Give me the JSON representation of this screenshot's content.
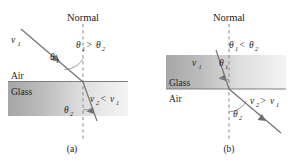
{
  "figure": {
    "caption_a": "(a)",
    "caption_b": "(b)"
  },
  "colors": {
    "background": "#ffffff",
    "ray": "#6f6f6f",
    "normal": "#8e8e8e",
    "interface": "#6f6f6f",
    "glass_dark": "#a9a9a9",
    "glass_light": "#f2f2f2",
    "text": "#1d1d1d"
  },
  "panel_a": {
    "label": "(a)",
    "normal_label": "Normal",
    "medium_upper": "Air",
    "medium_lower": "Glass",
    "incident_speed": {
      "symbol": "v",
      "subscript": "1"
    },
    "angle_incident": {
      "symbol": "θ",
      "subscript": "1"
    },
    "angle_refracted": {
      "symbol": "θ",
      "subscript": "2"
    },
    "angle_relation": {
      "left_symbol": "θ",
      "left_sub": "1",
      "operator": ">",
      "right_symbol": "θ",
      "right_sub": "2"
    },
    "speed_relation": {
      "left_symbol": "v",
      "left_sub": "2",
      "operator": "<",
      "right_symbol": "v",
      "right_sub": "1"
    }
  },
  "panel_b": {
    "label": "(b)",
    "normal_label": "Normal",
    "medium_upper": "Glass",
    "medium_lower": "Air",
    "incident_speed": {
      "symbol": "v",
      "subscript": "1"
    },
    "angle_incident": {
      "symbol": "θ",
      "subscript": "1"
    },
    "angle_refracted": {
      "symbol": "θ",
      "subscript": "2"
    },
    "angle_relation": {
      "left_symbol": "θ",
      "left_sub": "1",
      "operator": "<",
      "right_symbol": "θ",
      "right_sub": "2"
    },
    "speed_relation": {
      "left_symbol": "v",
      "left_sub": "2",
      "operator": ">",
      "right_symbol": "v",
      "right_sub": "1"
    }
  }
}
